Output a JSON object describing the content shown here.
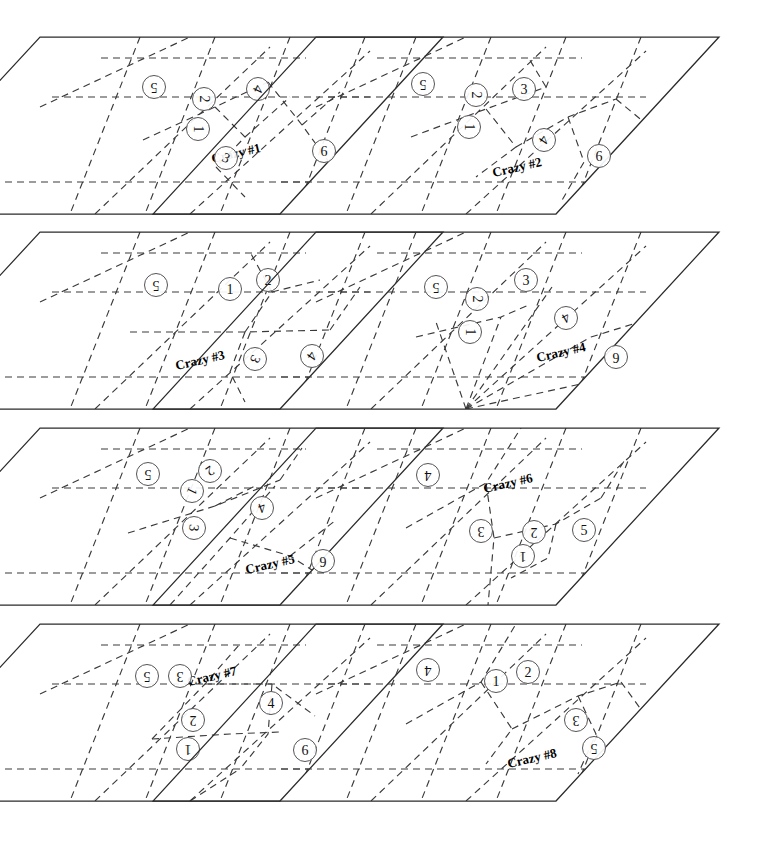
{
  "figure": {
    "panel_count": 8,
    "columns": 2,
    "rows": 4,
    "colors": {
      "background": "#ffffff",
      "outline": "#2b2b2b",
      "dashed": "#3a3a3a",
      "marker_stroke": "#555555",
      "text": "#111111"
    }
  },
  "panels": [
    {
      "id": "crazy-1",
      "label": "Crazy #1",
      "label_pos": {
        "x": 196,
        "y": 116,
        "rot": -13
      },
      "origin": {
        "x": 40,
        "y": 37
      },
      "size": {
        "w": 403,
        "h": 177
      },
      "skew_dx": -163,
      "markers": [
        {
          "n": "5",
          "x": 114,
          "y": 50,
          "rot": 180
        },
        {
          "n": "2",
          "x": 164,
          "y": 62,
          "rot": 90
        },
        {
          "n": "1",
          "x": 158,
          "y": 92,
          "rot": 90
        },
        {
          "n": "4",
          "x": 218,
          "y": 52,
          "rot": 115
        },
        {
          "n": "3",
          "x": 186,
          "y": 121,
          "rot": 25
        },
        {
          "n": "6",
          "x": 284,
          "y": 114,
          "rot": 0
        }
      ],
      "dashes": [
        "M 61 21 L 266 21",
        "M 12 60 L 330 60",
        "M -35 145 L 292 145",
        "M 100 0 L 30 177",
        "M 175 0 L 105 177",
        "M 250 0 L 180 177",
        "M 325 0 L 255 177",
        "M 0 70 L 150 0",
        "M 55 177 L 230 10",
        "M 150 177 L 330 14",
        "M 250 177 L 403 30",
        "M 103 103 L 175 70 L 228 45",
        "M 175 70 L 205 100 L 176 130",
        "M 205 100 L 250 60",
        "M 228 45 L 262 88 L 300 140",
        "M 176 130 L 205 160",
        "M 262 88 L 300 55"
      ]
    },
    {
      "id": "crazy-2",
      "label": "Crazy #2",
      "label_pos": {
        "x": 201,
        "y": 130,
        "rot": -13
      },
      "origin": {
        "x": 316,
        "y": 37
      },
      "size": {
        "w": 403,
        "h": 177
      },
      "skew_dx": -163,
      "markers": [
        {
          "n": "5",
          "x": 107,
          "y": 47,
          "rot": 180
        },
        {
          "n": "2",
          "x": 160,
          "y": 58,
          "rot": 90
        },
        {
          "n": "3",
          "x": 208,
          "y": 52,
          "rot": 0
        },
        {
          "n": "1",
          "x": 153,
          "y": 90,
          "rot": 90
        },
        {
          "n": "4",
          "x": 228,
          "y": 103,
          "rot": 125
        },
        {
          "n": "6",
          "x": 283,
          "y": 119,
          "rot": 0
        }
      ],
      "dashes": [
        "M 61 21 L 266 21",
        "M 12 60 L 330 60",
        "M -35 145 L 292 145",
        "M 100 0 L 30 177",
        "M 175 0 L 105 177",
        "M 250 0 L 180 177",
        "M 325 0 L 255 177",
        "M 0 70 L 150 0",
        "M 55 177 L 230 10",
        "M 150 177 L 330 14",
        "M 250 177 L 403 30",
        "M 95 100 L 170 72 L 230 50",
        "M 170 72 L 200 110 L 160 140",
        "M 230 50 L 212 20",
        "M 200 110 L 252 80 L 300 62",
        "M 252 80 L 268 125 L 245 165",
        "M 300 62 L 340 95"
      ]
    },
    {
      "id": "crazy-3",
      "label": "Crazy #3",
      "label_pos": {
        "x": 160,
        "y": 128,
        "rot": -13
      },
      "origin": {
        "x": 40,
        "y": 232
      },
      "size": {
        "w": 403,
        "h": 177
      },
      "skew_dx": -163,
      "markers": [
        {
          "n": "5",
          "x": 116,
          "y": 53,
          "rot": 180
        },
        {
          "n": "1",
          "x": 190,
          "y": 57,
          "rot": 0
        },
        {
          "n": "2",
          "x": 228,
          "y": 48,
          "rot": 0
        },
        {
          "n": "3",
          "x": 215,
          "y": 127,
          "rot": 115
        },
        {
          "n": "4",
          "x": 272,
          "y": 124,
          "rot": 125
        }
      ],
      "dashes": [
        "M 61 21 L 266 21",
        "M 12 60 L 330 60",
        "M -35 145 L 292 145",
        "M 100 0 L 30 177",
        "M 175 0 L 105 177",
        "M 250 0 L 180 177",
        "M 325 0 L 255 177",
        "M 0 70 L 150 0",
        "M 55 177 L 230 10",
        "M 150 177 L 330 14",
        "M 250 177 L 403 30",
        "M 90 100 L 205 100 L 290 98",
        "M 205 100 L 232 60 L 210 20",
        "M 290 98 L 320 55",
        "M 205 100 L 190 140 L 205 170",
        "M 232 60 L 280 48"
      ]
    },
    {
      "id": "crazy-4",
      "label": "Crazy #4",
      "label_pos": {
        "x": 245,
        "y": 120,
        "rot": -13
      },
      "origin": {
        "x": 316,
        "y": 232
      },
      "size": {
        "w": 403,
        "h": 177
      },
      "skew_dx": -163,
      "markers": [
        {
          "n": "5",
          "x": 120,
          "y": 55,
          "rot": 180
        },
        {
          "n": "2",
          "x": 161,
          "y": 67,
          "rot": 90
        },
        {
          "n": "3",
          "x": 210,
          "y": 48,
          "rot": 0
        },
        {
          "n": "1",
          "x": 154,
          "y": 100,
          "rot": 90
        },
        {
          "n": "4",
          "x": 250,
          "y": 86,
          "rot": 150
        },
        {
          "n": "6",
          "x": 300,
          "y": 125,
          "rot": 180
        }
      ],
      "dashes": [
        "M 61 21 L 266 21",
        "M 12 60 L 330 60",
        "M -35 145 L 292 145",
        "M 100 0 L 30 177",
        "M 175 0 L 105 177",
        "M 250 0 L 180 177",
        "M 325 0 L 255 177",
        "M 0 70 L 150 0",
        "M 55 177 L 230 10",
        "M 150 177 L 330 14",
        "M 250 177 L 403 30",
        "M 150 177 L 120 90",
        "M 150 177 L 185 85",
        "M 150 177 L 236 55",
        "M 150 177 L 275 105",
        "M 150 177 L 320 140",
        "M 100 105 L 185 85 L 215 72",
        "M 275 105 L 330 88"
      ]
    },
    {
      "id": "crazy-5",
      "label": "Crazy #5",
      "label_pos": {
        "x": 230,
        "y": 136,
        "rot": -13
      },
      "origin": {
        "x": 40,
        "y": 428
      },
      "size": {
        "w": 403,
        "h": 177
      },
      "skew_dx": -163,
      "markers": [
        {
          "n": "5",
          "x": 108,
          "y": 46,
          "rot": 180
        },
        {
          "n": "2",
          "x": 170,
          "y": 43,
          "rot": 145
        },
        {
          "n": "1",
          "x": 152,
          "y": 63,
          "rot": 115
        },
        {
          "n": "4",
          "x": 222,
          "y": 80,
          "rot": 160
        },
        {
          "n": "3",
          "x": 154,
          "y": 100,
          "rot": 95
        },
        {
          "n": "6",
          "x": 283,
          "y": 133,
          "rot": 180
        }
      ],
      "dashes": [
        "M 61 21 L 266 21",
        "M 12 60 L 330 60",
        "M -35 145 L 292 145",
        "M 100 0 L 30 177",
        "M 175 0 L 105 177",
        "M 250 0 L 180 177",
        "M 325 0 L 255 177",
        "M 0 70 L 150 0",
        "M 55 177 L 230 10",
        "M 150 177 L 330 14",
        "M 250 177 L 403 30",
        "M 88 105 L 175 78 L 240 52",
        "M 175 78 L 215 58",
        "M 130 177 L 190 110 L 235 58",
        "M 190 110 L 250 128 L 300 160",
        "M 240 52 L 262 20",
        "M 250 128 L 296 92"
      ]
    },
    {
      "id": "crazy-6",
      "label": "Crazy #6",
      "label_pos": {
        "x": 192,
        "y": 55,
        "rot": -13
      },
      "origin": {
        "x": 316,
        "y": 428
      },
      "size": {
        "w": 403,
        "h": 177
      },
      "skew_dx": -163,
      "markers": [
        {
          "n": "4",
          "x": 112,
          "y": 47,
          "rot": 180
        },
        {
          "n": "3",
          "x": 165,
          "y": 103,
          "rot": 180
        },
        {
          "n": "2",
          "x": 218,
          "y": 104,
          "rot": 180
        },
        {
          "n": "1",
          "x": 207,
          "y": 128,
          "rot": 180
        },
        {
          "n": "5",
          "x": 268,
          "y": 102,
          "rot": 0
        }
      ],
      "dashes": [
        "M 61 21 L 266 21",
        "M 12 60 L 330 60",
        "M -35 145 L 292 145",
        "M 100 0 L 30 177",
        "M 175 0 L 105 177",
        "M 250 0 L 180 177",
        "M 325 0 L 255 177",
        "M 0 70 L 150 0",
        "M 55 177 L 230 10",
        "M 150 177 L 330 14",
        "M 250 177 L 403 30",
        "M 90 100 L 170 55 L 205 0",
        "M 170 55 L 178 110 L 172 177",
        "M 178 110 L 240 96 L 285 70",
        "M 240 96 L 232 130 L 195 150",
        "M 285 70 L 310 30"
      ]
    },
    {
      "id": "crazy-7",
      "label": "Crazy #7",
      "label_pos": {
        "x": 172,
        "y": 52,
        "rot": -13
      },
      "origin": {
        "x": 40,
        "y": 624
      },
      "size": {
        "w": 403,
        "h": 177
      },
      "skew_dx": -163,
      "markers": [
        {
          "n": "5",
          "x": 107,
          "y": 52,
          "rot": 180
        },
        {
          "n": "3",
          "x": 140,
          "y": 52,
          "rot": 180
        },
        {
          "n": "4",
          "x": 231,
          "y": 79,
          "rot": 0
        },
        {
          "n": "2",
          "x": 153,
          "y": 96,
          "rot": 180
        },
        {
          "n": "1",
          "x": 148,
          "y": 125,
          "rot": 180
        },
        {
          "n": "6",
          "x": 265,
          "y": 126,
          "rot": 0
        }
      ],
      "dashes": [
        "M 61 21 L 266 21",
        "M 12 60 L 330 60",
        "M -35 145 L 292 145",
        "M 100 0 L 30 177",
        "M 175 0 L 105 177",
        "M 250 0 L 180 177",
        "M 325 0 L 255 177",
        "M 0 70 L 150 0",
        "M 55 177 L 230 10",
        "M 150 177 L 330 14",
        "M 250 177 L 403 30",
        "M 112 115 L 165 60 L 200 20",
        "M 165 60 L 232 60 L 275 92",
        "M 232 60 L 228 110 L 200 145",
        "M 112 115 L 190 110 L 240 108",
        "M 150 177 L 200 145"
      ]
    },
    {
      "id": "crazy-8",
      "label": "Crazy #8",
      "label_pos": {
        "x": 216,
        "y": 134,
        "rot": -13
      },
      "origin": {
        "x": 316,
        "y": 624
      },
      "size": {
        "w": 403,
        "h": 177
      },
      "skew_dx": -163,
      "markers": [
        {
          "n": "4",
          "x": 112,
          "y": 46,
          "rot": 180
        },
        {
          "n": "1",
          "x": 180,
          "y": 57,
          "rot": 0
        },
        {
          "n": "2",
          "x": 212,
          "y": 48,
          "rot": 0
        },
        {
          "n": "3",
          "x": 260,
          "y": 96,
          "rot": 180
        },
        {
          "n": "5",
          "x": 278,
          "y": 124,
          "rot": 180
        }
      ],
      "dashes": [
        "M 61 21 L 266 21",
        "M 12 60 L 330 60",
        "M -35 145 L 292 145",
        "M 100 0 L 30 177",
        "M 175 0 L 105 177",
        "M 250 0 L 180 177",
        "M 325 0 L 255 177",
        "M 0 70 L 150 0",
        "M 55 177 L 230 10",
        "M 150 177 L 330 14",
        "M 250 177 L 403 30",
        "M 90 100 L 165 58 L 200 0",
        "M 165 58 L 196 105 L 170 140",
        "M 196 105 L 262 72 L 305 58",
        "M 262 72 L 280 110 L 262 150",
        "M 305 58 L 332 95"
      ]
    }
  ]
}
